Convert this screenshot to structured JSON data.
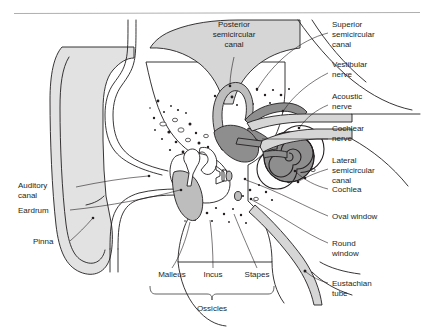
{
  "figure": {
    "background_color": "#ffffff",
    "ink_color": "#231f20",
    "rule_color": "#9a9a9a"
  },
  "labels": {
    "top": {
      "posterior_semicircular_canal": "Posterior\nsemicircular\ncanal",
      "posterior_line1": "Posterior",
      "posterior_line2": "semicircular",
      "posterior_line3": "canal"
    },
    "right": [
      {
        "id": "superior-semicircular-canal",
        "lines": [
          "Superior",
          "semicircular",
          "canal"
        ]
      },
      {
        "id": "vestibular-nerve",
        "lines": [
          "Vestibular",
          "nerve"
        ]
      },
      {
        "id": "acoustic-nerve",
        "lines": [
          "Acoustic",
          "nerve"
        ]
      },
      {
        "id": "cochlear-nerve",
        "lines": [
          "Cochlear",
          "nerve"
        ]
      },
      {
        "id": "lateral-semicircular-canal",
        "lines": [
          "Lateral",
          "semicircular",
          "canal"
        ]
      },
      {
        "id": "cochlea",
        "lines": [
          "Cochlea"
        ]
      },
      {
        "id": "oval-window",
        "lines": [
          "Oval window"
        ]
      },
      {
        "id": "round-window",
        "lines": [
          "Round",
          "window"
        ]
      },
      {
        "id": "eustachian-tube",
        "lines": [
          "Eustachian",
          "tube"
        ]
      }
    ],
    "left": [
      {
        "id": "auditory-canal",
        "lines": [
          "Auditory",
          "canal"
        ]
      },
      {
        "id": "eardrum",
        "lines": [
          "Eardrum"
        ]
      },
      {
        "id": "pinna",
        "lines": [
          "Pinna"
        ]
      }
    ],
    "bottom": {
      "malleus": "Malleus",
      "incus": "Incus",
      "stapes": "Stapes",
      "ossicles": "Ossicles"
    }
  }
}
